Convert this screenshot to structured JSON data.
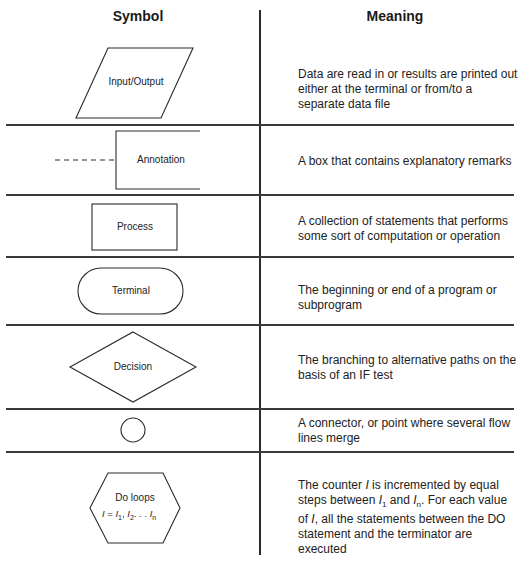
{
  "headers": {
    "symbol": "Symbol",
    "meaning": "Meaning"
  },
  "rows": [
    {
      "symbol": "Input/Output",
      "shape": "parallelogram",
      "meaning": "Data are read in or results are printed out either at the terminal or from/to a separate data file"
    },
    {
      "symbol": "Annotation",
      "shape": "open-bracket-with-dashed-line",
      "meaning": "A box that contains explanatory remarks"
    },
    {
      "symbol": "Process",
      "shape": "rectangle",
      "meaning": "A collection of statements that performs some sort of computation or operation"
    },
    {
      "symbol": "Terminal",
      "shape": "rounded-rectangle",
      "meaning": "The beginning or end of a program or subprogram"
    },
    {
      "symbol": "Decision",
      "shape": "diamond",
      "meaning": "The branching to alternative paths on the basis of an IF test"
    },
    {
      "symbol": "",
      "shape": "circle",
      "meaning": "A connector, or point where several flow lines merge"
    },
    {
      "symbol": "Do loops",
      "shape": "hexagon",
      "formula": {
        "var": "I",
        "eq": " = ",
        "t1": "I",
        "s1": "1",
        "t2": "I",
        "s2": "2",
        "dots": ". . . ",
        "tn": "I",
        "sn": "n"
      },
      "meaning_parts": {
        "p1": "The counter ",
        "v1": "I",
        "p2": " is incremented by equal steps between ",
        "v2": "I",
        "v2sub": "1",
        "p3": " and ",
        "v3": "I",
        "v3sub": "n",
        "p4": ".  For each value of ",
        "v4": "I",
        "p5": ", all the statements between the DO statement and the terminator are executed"
      }
    }
  ]
}
